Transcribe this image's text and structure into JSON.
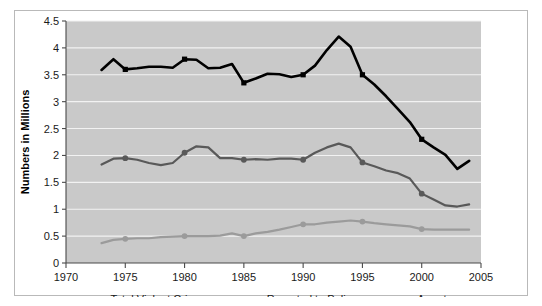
{
  "figure": {
    "background_color": "#ffffff",
    "plot_background_color": "#c9c9c9",
    "gridline_color": "#f2f2f2",
    "axis_color": "#4a4a4a"
  },
  "chart_data": {
    "type": "line",
    "title": "",
    "subtitle": "",
    "xlabel": "",
    "ylabel": "Numbers in Millions",
    "xlim": [
      1970,
      2005
    ],
    "ylim": [
      0,
      4.5
    ],
    "xticks": [
      1970,
      1975,
      1980,
      1985,
      1990,
      1995,
      2000,
      2005
    ],
    "xtick_labels": [
      "1970",
      "1975",
      "1980",
      "1985",
      "1990",
      "1995",
      "2000",
      "2005"
    ],
    "yticks": [
      0,
      0.5,
      1,
      1.5,
      2,
      2.5,
      3,
      3.5,
      4,
      4.5
    ],
    "ytick_labels": [
      "0",
      "0.5",
      "1",
      "1.5",
      "2",
      "2.5",
      "3",
      "3.5",
      "4",
      "4.5"
    ],
    "grid": true,
    "grid_axis": "y",
    "legend_position": "bottom",
    "x": [
      1973,
      1974,
      1975,
      1976,
      1977,
      1978,
      1979,
      1980,
      1981,
      1982,
      1983,
      1984,
      1985,
      1986,
      1987,
      1988,
      1989,
      1990,
      1991,
      1992,
      1993,
      1994,
      1995,
      1996,
      1997,
      1998,
      1999,
      2000,
      2001,
      2002,
      2003,
      2004
    ],
    "series": [
      {
        "name": "Total Violent Crime",
        "color": "#000000",
        "width": 2.6,
        "marker_years": [
          1975,
          1980,
          1985,
          1990,
          1995,
          2000
        ],
        "values": [
          3.59,
          3.79,
          3.6,
          3.62,
          3.65,
          3.65,
          3.63,
          3.79,
          3.78,
          3.62,
          3.63,
          3.7,
          3.35,
          3.43,
          3.52,
          3.51,
          3.46,
          3.5,
          3.67,
          3.96,
          4.21,
          4.02,
          3.5,
          3.32,
          3.1,
          2.86,
          2.62,
          2.3,
          2.15,
          2.01,
          1.75,
          1.9
        ]
      },
      {
        "name": "Reported to Police",
        "color": "#595959",
        "width": 2.2,
        "marker_years": [
          1975,
          1980,
          1985,
          1990,
          1995,
          2000
        ],
        "values": [
          1.83,
          1.94,
          1.95,
          1.92,
          1.86,
          1.82,
          1.86,
          2.05,
          2.17,
          2.15,
          1.95,
          1.95,
          1.92,
          1.93,
          1.92,
          1.94,
          1.94,
          1.92,
          2.05,
          2.15,
          2.22,
          2.15,
          1.87,
          1.8,
          1.72,
          1.67,
          1.57,
          1.29,
          1.18,
          1.07,
          1.05,
          1.09
        ]
      },
      {
        "name": "Arrests",
        "color": "#9b9b9b",
        "width": 2.2,
        "marker_years": [
          1975,
          1980,
          1985,
          1990,
          1995,
          2000
        ],
        "values": [
          0.37,
          0.43,
          0.45,
          0.46,
          0.46,
          0.48,
          0.49,
          0.5,
          0.5,
          0.5,
          0.51,
          0.55,
          0.5,
          0.55,
          0.58,
          0.62,
          0.67,
          0.72,
          0.72,
          0.75,
          0.77,
          0.79,
          0.77,
          0.74,
          0.72,
          0.7,
          0.68,
          0.63,
          0.62,
          0.62,
          0.62,
          0.62
        ]
      }
    ]
  },
  "legend": {
    "items": [
      {
        "label": "Total Violent Crime",
        "color": "#000000"
      },
      {
        "label": "Reported to Police",
        "color": "#595959"
      },
      {
        "label": "Arrests",
        "color": "#9b9b9b"
      }
    ]
  }
}
